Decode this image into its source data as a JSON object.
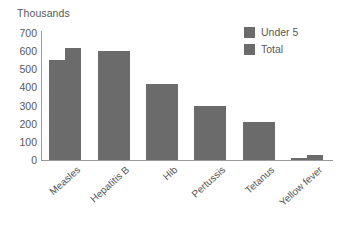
{
  "chart_data": {
    "type": "bar",
    "title": "",
    "unit_label": "Thousands",
    "xlabel": "",
    "ylabel": "Thousands",
    "ylim": [
      0,
      700
    ],
    "yticks": [
      0,
      100,
      200,
      300,
      400,
      500,
      600,
      700
    ],
    "ytick_labels": [
      "0",
      "100",
      "200",
      "300",
      "400",
      "500",
      "600",
      "700"
    ],
    "grid": false,
    "legend_position": "top-right",
    "categories": [
      "Measles",
      "Hepatitis B",
      "Hib",
      "Pertussis",
      "Tetanus",
      "Yellow fever"
    ],
    "series": [
      {
        "name": "Under 5",
        "color": "#6b6b6b",
        "values": [
          550,
          600,
          420,
          300,
          210,
          10
        ]
      },
      {
        "name": "Total",
        "color": "#6b6b6b",
        "values": [
          620,
          600,
          420,
          300,
          210,
          30
        ]
      }
    ]
  },
  "legend": {
    "items": [
      {
        "label": "Under 5",
        "color": "#6b6b6b"
      },
      {
        "label": "Total",
        "color": "#6b6b6b"
      }
    ]
  },
  "axis": {
    "unit_title": "Thousands"
  }
}
